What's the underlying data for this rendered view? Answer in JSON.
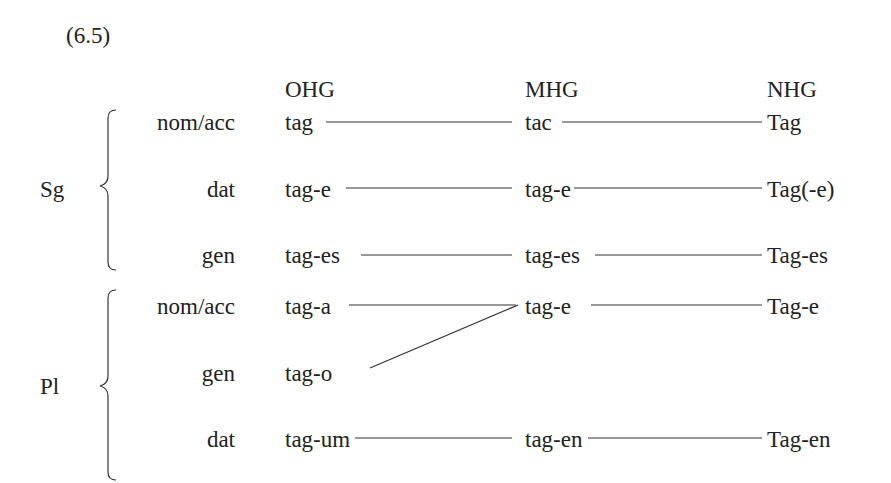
{
  "example_number": "(6.5)",
  "columns": {
    "ohg": "OHG",
    "mhg": "MHG",
    "nhg": "NHG"
  },
  "groups": {
    "singular": {
      "label": "Sg",
      "rows": [
        {
          "case": "nom/acc",
          "ohg": "tag",
          "mhg": "tac",
          "nhg": "Tag"
        },
        {
          "case": "dat",
          "ohg": "tag-e",
          "mhg": "tag-e",
          "nhg": "Tag(-e)"
        },
        {
          "case": "gen",
          "ohg": "tag-es",
          "mhg": "tag-es",
          "nhg": "Tag-es"
        }
      ]
    },
    "plural": {
      "label": "Pl",
      "rows": [
        {
          "case": "nom/acc",
          "ohg": "tag-a",
          "mhg": "tag-e",
          "nhg": "Tag-e"
        },
        {
          "case": "gen",
          "ohg": "tag-o",
          "mhg": "",
          "nhg": ""
        },
        {
          "case": "dat",
          "ohg": "tag-um",
          "mhg": "tag-en",
          "nhg": "Tag-en"
        }
      ]
    }
  }
}
